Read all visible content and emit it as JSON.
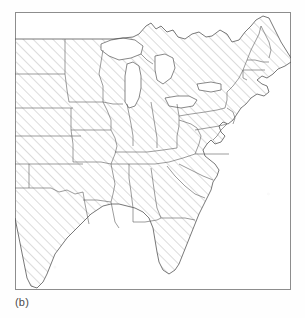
{
  "figure": {
    "caption": "(b)",
    "title": "",
    "kind": "map",
    "region": "Eastern and Central United States",
    "projection_note": "",
    "frame": {
      "visible": true,
      "border_color": "#8d8d8d",
      "left": 15,
      "top": 12,
      "width": 276,
      "height": 278
    },
    "background_color": "#ffffff",
    "outline_color": "#555555",
    "hatch": {
      "present": true,
      "direction": "diagonal-up-right",
      "angle_deg": 45,
      "spacing_px": 7,
      "color": "#9a9a9a",
      "line_width_px": 0.7
    },
    "shaded_area_label": "hatched study region",
    "legend": {
      "present": false,
      "entries": []
    },
    "axes": {
      "present": false,
      "tick_labels": []
    },
    "annotations": []
  },
  "map_data": {
    "type": "choropleth-hatched",
    "shaded_states": [
      "North Dakota",
      "South Dakota",
      "Nebraska",
      "Kansas",
      "Oklahoma",
      "Texas",
      "Minnesota",
      "Iowa",
      "Missouri",
      "Arkansas",
      "Louisiana",
      "Wisconsin",
      "Illinois",
      "Michigan",
      "Indiana",
      "Ohio",
      "Kentucky",
      "Tennessee",
      "Mississippi",
      "Alabama",
      "Georgia",
      "Florida",
      "South Carolina",
      "North Carolina",
      "Virginia",
      "West Virginia",
      "Maryland",
      "Delaware",
      "Pennsylvania",
      "New Jersey",
      "New York",
      "Connecticut",
      "Rhode Island",
      "Massachusetts",
      "Vermont",
      "New Hampshire",
      "Maine"
    ],
    "unshaded_features": [
      "Lake Superior",
      "Lake Michigan",
      "Lake Huron",
      "Lake Erie",
      "Lake Ontario",
      "Atlantic Ocean",
      "Gulf of Mexico"
    ],
    "water_bodies_drawn": [
      "Great Lakes",
      "Chesapeake Bay",
      "Gulf of Mexico coastline",
      "Atlantic coastline"
    ],
    "values": [],
    "categories": []
  }
}
